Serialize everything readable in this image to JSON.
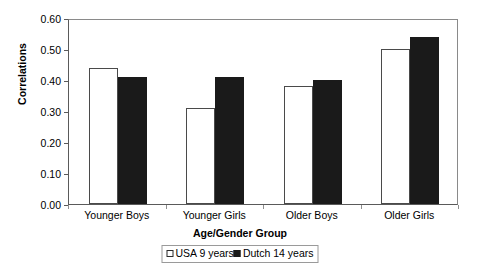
{
  "chart_data": {
    "type": "bar",
    "title": "",
    "xlabel": "Age/Gender Group",
    "ylabel": "Correlations",
    "categories": [
      "Younger Boys",
      "Younger Girls",
      "Older Boys",
      "Older Girls"
    ],
    "series": [
      {
        "name": "USA 9 years",
        "values": [
          0.44,
          0.31,
          0.38,
          0.5
        ],
        "style": "open",
        "color": "#ffffff"
      },
      {
        "name": "Dutch 14 years",
        "values": [
          0.41,
          0.41,
          0.4,
          0.54
        ],
        "style": "filled",
        "color": "#1a1a1a"
      }
    ],
    "ylim": [
      0.0,
      0.6
    ],
    "yticks": [
      0.0,
      0.1,
      0.2,
      0.3,
      0.4,
      0.5,
      0.6
    ],
    "ytick_labels": [
      "0.00",
      "0.10",
      "0.20",
      "0.30",
      "0.40",
      "0.50",
      "0.60"
    ],
    "grid": false,
    "legend_position": "bottom-center"
  },
  "legend": {
    "entries": [
      {
        "label": "USA 9 years"
      },
      {
        "label": "Dutch 14 years"
      }
    ]
  }
}
